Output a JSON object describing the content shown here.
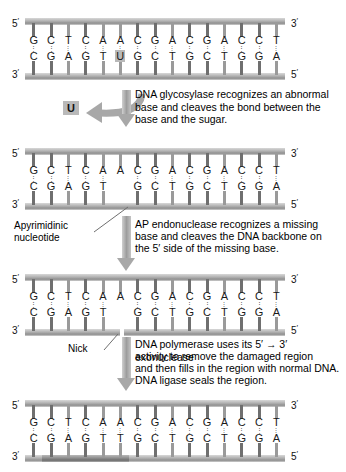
{
  "diagram": {
    "accent_gray": "#9a9a9a",
    "highlight_gray": "#b9b9b9"
  },
  "end_labels": {
    "five": "5",
    "three": "3",
    "prime": "′"
  },
  "panels": [
    {
      "id": "panel-1",
      "name": "damaged-dna",
      "left_top": "5",
      "right_top": "3",
      "left_bottom": "3",
      "right_bottom": "5",
      "top_strand": [
        "G",
        "C",
        "T",
        "C",
        "A",
        "A",
        "C",
        "G",
        "A",
        "C",
        "G",
        "A",
        "C",
        "C",
        "T"
      ],
      "bottom_strand": [
        "C",
        "G",
        "A",
        "G",
        "T",
        "U",
        "G",
        "C",
        "T",
        "G",
        "C",
        "T",
        "G",
        "G",
        "A"
      ],
      "bonds": [
        3,
        3,
        2,
        3,
        2,
        2,
        3,
        3,
        2,
        3,
        3,
        2,
        3,
        3,
        2
      ],
      "highlight_index": 5,
      "highlight_base": "U"
    },
    {
      "id": "panel-2",
      "name": "apyrimidinic-site-dna",
      "left_top": "5",
      "right_top": "3",
      "left_bottom": "3",
      "right_bottom": "5",
      "top_strand": [
        "G",
        "C",
        "T",
        "C",
        "A",
        "A",
        "C",
        "G",
        "A",
        "C",
        "G",
        "A",
        "C",
        "C",
        "T"
      ],
      "bottom_strand": [
        "C",
        "G",
        "A",
        "G",
        "T",
        "",
        "G",
        "C",
        "T",
        "G",
        "C",
        "T",
        "G",
        "G",
        "A"
      ],
      "bonds": [
        3,
        3,
        2,
        3,
        2,
        2,
        3,
        3,
        2,
        3,
        3,
        2,
        3,
        3,
        2
      ],
      "missing_index": 5
    },
    {
      "id": "panel-3",
      "name": "nicked-dna",
      "left_top": "5",
      "right_top": "3",
      "left_bottom": "3",
      "right_bottom": "5",
      "top_strand": [
        "G",
        "C",
        "T",
        "C",
        "A",
        "A",
        "C",
        "G",
        "A",
        "C",
        "G",
        "A",
        "C",
        "C",
        "T"
      ],
      "bottom_strand": [
        "C",
        "G",
        "A",
        "G",
        "T",
        "",
        "G",
        "C",
        "T",
        "G",
        "C",
        "T",
        "G",
        "G",
        "A"
      ],
      "bonds": [
        3,
        3,
        2,
        3,
        2,
        2,
        3,
        3,
        2,
        3,
        3,
        2,
        3,
        3,
        2
      ],
      "missing_index": 5,
      "nick_index": 5
    },
    {
      "id": "panel-4",
      "name": "repaired-dna",
      "left_top": "5",
      "right_top": "3",
      "left_bottom": "3",
      "right_bottom": "5",
      "top_strand": [
        "G",
        "C",
        "T",
        "C",
        "A",
        "A",
        "C",
        "G",
        "A",
        "C",
        "G",
        "A",
        "C",
        "C",
        "T"
      ],
      "bottom_strand": [
        "C",
        "G",
        "A",
        "G",
        "T",
        "T",
        "G",
        "C",
        "T",
        "G",
        "C",
        "T",
        "G",
        "G",
        "A"
      ],
      "bonds": [
        3,
        3,
        2,
        3,
        2,
        2,
        3,
        3,
        2,
        3,
        3,
        2,
        3,
        3,
        2
      ],
      "repaired_from": 1,
      "repaired_to": 6
    }
  ],
  "steps": [
    {
      "id": "step-1",
      "name": "glycosylase-step",
      "text": "DNA glycosylase recognizes an abnormal base and cleaves the bond between the base and the sugar.",
      "released_base": "U"
    },
    {
      "id": "step-2",
      "name": "ap-endonuclease-step",
      "text_lines": [
        "AP endonuclease recognizes a missing",
        "base and cleaves the DNA backbone on",
        "the 5′ side of the missing base."
      ]
    },
    {
      "id": "step-3",
      "name": "polymerase-ligase-step",
      "text_lines": [
        "DNA polymerase uses its 5′ → 3′ exonuclease",
        "activity to remove the damaged region",
        "and then fills in the region with normal DNA.",
        "DNA ligase seals the region."
      ]
    }
  ],
  "callouts": [
    {
      "id": "callout-apyrimidinic",
      "name": "apyrimidinic-nucleotide-label",
      "line1": "Apyrimidinic",
      "line2": "nucleotide"
    },
    {
      "id": "callout-nick",
      "name": "nick-label",
      "line1": "Nick",
      "line2": ""
    }
  ]
}
